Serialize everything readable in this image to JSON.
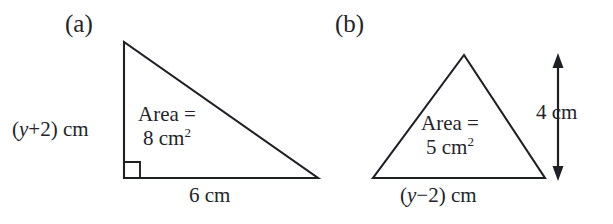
{
  "figure": {
    "background_color": "#ffffff",
    "stroke_color": "#1f2024",
    "text_color": "#23242a"
  },
  "parts": [
    {
      "id": "a",
      "label": "(a)",
      "shape": "right-triangle",
      "area_line1": "Area =",
      "area_value": "8",
      "area_unit": "cm",
      "area_exponent": "2",
      "vertical_side": {
        "open_paren": "(",
        "variable": "y",
        "operator": "+",
        "constant": "2",
        "close_paren": ")",
        "unit": "cm"
      },
      "base_label": "6 cm",
      "right_angle_marker": true
    },
    {
      "id": "b",
      "label": "(b)",
      "shape": "triangle",
      "area_line1": "Area =",
      "area_value": "5",
      "area_unit": "cm",
      "area_exponent": "2",
      "base_side": {
        "open_paren": "(",
        "variable": "y",
        "operator": "−",
        "constant": "2",
        "close_paren": ")",
        "unit": "cm"
      },
      "height_label": "4 cm",
      "height_arrow": "double-headed-vertical"
    }
  ]
}
